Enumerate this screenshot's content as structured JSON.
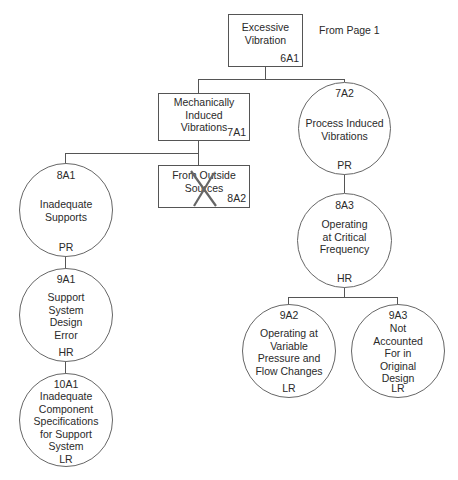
{
  "diagram": {
    "type": "fault-tree",
    "annotation": "From Page 1",
    "nodes": {
      "n6A1": {
        "code": "6A1",
        "text": "Excessive\nVibration",
        "shape": "box"
      },
      "n7A1": {
        "code": "7A1",
        "text": "Mechanically\nInduced\nVibrations",
        "shape": "box"
      },
      "n7A2": {
        "code": "7A2",
        "text": "Process Induced\nVibrations",
        "rating": "PR",
        "shape": "circle"
      },
      "n8A1": {
        "code": "8A1",
        "text": "Inadequate\nSupports",
        "rating": "PR",
        "shape": "circle"
      },
      "n8A2": {
        "code": "8A2",
        "text": "From Outside\nSources",
        "shape": "box",
        "crossed_out": true
      },
      "n8A3": {
        "code": "8A3",
        "text": "Operating\nat Critical\nFrequency",
        "rating": "HR",
        "shape": "circle"
      },
      "n9A1": {
        "code": "9A1",
        "text": "Support\nSystem\nDesign\nError",
        "rating": "HR",
        "shape": "circle"
      },
      "n9A2": {
        "code": "9A2",
        "text": "Operating at\nVariable\nPressure and\nFlow Changes",
        "rating": "LR",
        "shape": "circle"
      },
      "n9A3": {
        "code": "9A3",
        "text": "Not\nAccounted\nFor in\nOriginal\nDesign",
        "rating": "LR",
        "shape": "circle"
      },
      "n10A1": {
        "code": "10A1",
        "text": "Inadequate\nComponent\nSpecifications\nfor Support\nSystem",
        "rating": "LR",
        "shape": "circle"
      }
    },
    "edges": [
      [
        "6A1",
        "7A1"
      ],
      [
        "6A1",
        "7A2"
      ],
      [
        "7A1",
        "8A1"
      ],
      [
        "7A1",
        "8A2"
      ],
      [
        "7A2",
        "8A3"
      ],
      [
        "8A1",
        "9A1"
      ],
      [
        "9A1",
        "10A1"
      ],
      [
        "8A3",
        "9A2"
      ],
      [
        "8A3",
        "9A3"
      ]
    ],
    "colors": {
      "line": "#555555",
      "cross": "#666666",
      "text": "#2a2a2a"
    }
  }
}
